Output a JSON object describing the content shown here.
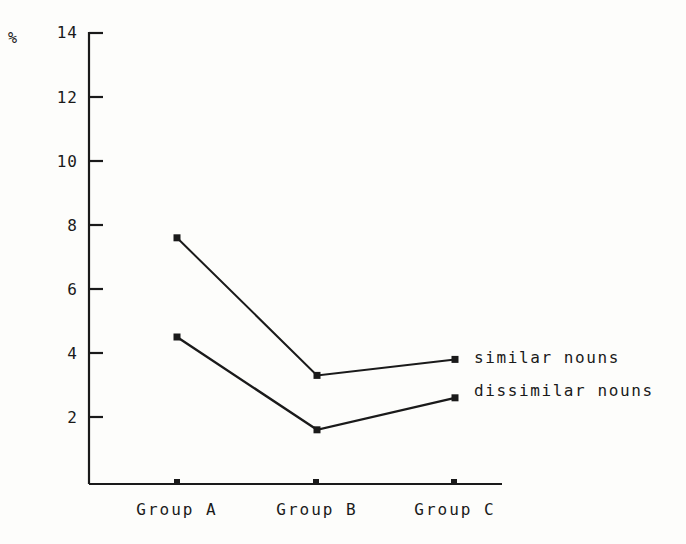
{
  "chart_data": {
    "type": "line",
    "title": "",
    "xlabel": "",
    "ylabel": "%",
    "categories": [
      "Group A",
      "Group B",
      "Group C"
    ],
    "series": [
      {
        "name": "similar nouns",
        "values": [
          7.6,
          3.3,
          3.8
        ]
      },
      {
        "name": "dissimilar nouns",
        "values": [
          4.5,
          1.6,
          2.6
        ]
      }
    ],
    "ylim": [
      0,
      14
    ],
    "yticks": [
      2,
      4,
      6,
      8,
      10,
      12,
      14
    ],
    "ytick_labels": [
      "2",
      "4",
      "6",
      "8",
      "10",
      "12",
      "14"
    ],
    "grid": false,
    "legend_position": "line-end-labels",
    "marker": "square",
    "line_color": "#1a1a1a",
    "background_color": "#fdfdfb"
  },
  "axes": {
    "unit_symbol": "%",
    "y_labels": [
      "14",
      "12",
      "10",
      "8",
      "6",
      "4",
      "2"
    ],
    "x_labels": [
      "Group A",
      "Group B",
      "Group C"
    ]
  },
  "annotations": {
    "similar_label": "similar nouns",
    "dissimilar_label": "dissimilar nouns"
  }
}
